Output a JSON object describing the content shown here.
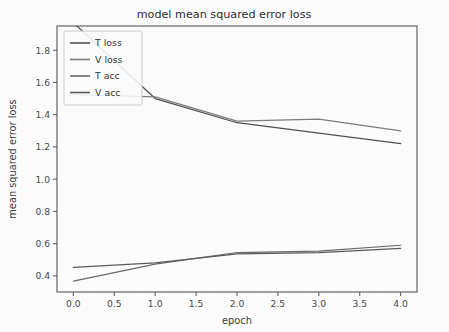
{
  "chart_data": {
    "type": "line",
    "title": "model mean squared error loss",
    "xlabel": "epoch",
    "ylabel": "mean squared error loss",
    "x": [
      0,
      1,
      2,
      3,
      4
    ],
    "xlim": [
      -0.2,
      4.2
    ],
    "ylim": [
      0.3,
      1.95
    ],
    "xticks": [
      0.0,
      0.5,
      1.0,
      1.5,
      2.0,
      2.5,
      3.0,
      3.5,
      4.0
    ],
    "xtick_labels": [
      "0.0",
      "0.5",
      "1.0",
      "1.5",
      "2.0",
      "2.5",
      "3.0",
      "3.5",
      "4.0"
    ],
    "yticks": [
      0.4,
      0.6,
      0.8,
      1.0,
      1.2,
      1.4,
      1.6,
      1.8
    ],
    "ytick_labels": [
      "0.4",
      "0.6",
      "0.8",
      "1.0",
      "1.2",
      "1.4",
      "1.6",
      "1.8"
    ],
    "grid": false,
    "legend_position": "upper left",
    "series": [
      {
        "name": "T loss",
        "values": [
          1.97,
          1.5,
          1.35,
          1.285,
          1.22
        ],
        "color": "#4f4f4f"
      },
      {
        "name": "V loss",
        "values": [
          1.525,
          1.51,
          1.36,
          1.372,
          1.3
        ],
        "color": "#7d7d7d"
      },
      {
        "name": "T acc",
        "values": [
          0.368,
          0.473,
          0.545,
          0.553,
          0.59
        ],
        "color": "#6a6a6a"
      },
      {
        "name": "V acc",
        "values": [
          0.452,
          0.481,
          0.536,
          0.545,
          0.57
        ],
        "color": "#5a5a5a"
      }
    ]
  },
  "legend": {
    "entries": [
      "T loss",
      "V loss",
      "T acc",
      "V acc"
    ]
  },
  "figure": {
    "background_color": "#fdfdfd",
    "axis_color": "#585858",
    "text_color": "#333333"
  }
}
